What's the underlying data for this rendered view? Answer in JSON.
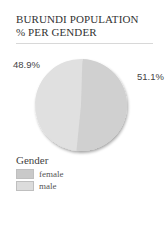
{
  "chart_data": {
    "type": "pie",
    "title": "BURUNDI POPULATION % PER GENDER",
    "title_lines": [
      "BURUNDI POPULATION",
      "% PER GENDER"
    ],
    "slices": [
      {
        "name": "female",
        "value": 51.1,
        "label": "51.1%",
        "color": "#d0d0d0"
      },
      {
        "name": "male",
        "value": 48.9,
        "label": "48.9%",
        "color": "#e0e0e0"
      }
    ],
    "legend": {
      "title": "Gender",
      "placement": "bottom-left",
      "items": [
        {
          "label": "female",
          "color": "#c9c9c9"
        },
        {
          "label": "male",
          "color": "#dcdcdc"
        }
      ]
    }
  }
}
